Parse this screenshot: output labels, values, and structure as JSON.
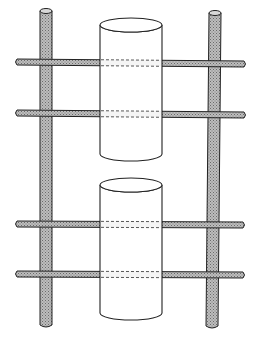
{
  "diagram": {
    "colors": {
      "background": "#ffffff",
      "stroke": "#222222",
      "rod_fill": "#a8a8a8",
      "rod_pattern_light": "#d0d0d0",
      "cylinder_fill": "#ffffff"
    },
    "posts": [
      {
        "name": "left-post",
        "x_top": 46,
        "x_bottom": 46,
        "y_top": 11,
        "y_bottom": 327,
        "width": 12
      },
      {
        "name": "right-post",
        "x_top": 215,
        "x_bottom": 212,
        "y_top": 13,
        "y_bottom": 328,
        "width": 12
      }
    ],
    "crossbars": [
      {
        "name": "crossbar-1",
        "y_left": 62,
        "y_right": 64,
        "x_left": 15,
        "x_right": 246
      },
      {
        "name": "crossbar-2",
        "y_left": 113,
        "y_right": 115,
        "x_left": 15,
        "x_right": 246
      },
      {
        "name": "crossbar-3",
        "y_left": 224,
        "y_right": 225,
        "x_left": 15,
        "x_right": 245
      },
      {
        "name": "crossbar-4",
        "y_left": 274,
        "y_right": 275,
        "x_left": 15,
        "x_right": 245
      }
    ],
    "cylinders": [
      {
        "name": "upper-cylinder",
        "cx": 131,
        "rx": 31,
        "ry": 7,
        "y_top": 25,
        "y_bottom": 154
      },
      {
        "name": "lower-cylinder",
        "cx": 131,
        "rx": 31,
        "ry": 7,
        "y_top": 185,
        "y_bottom": 313
      }
    ]
  }
}
